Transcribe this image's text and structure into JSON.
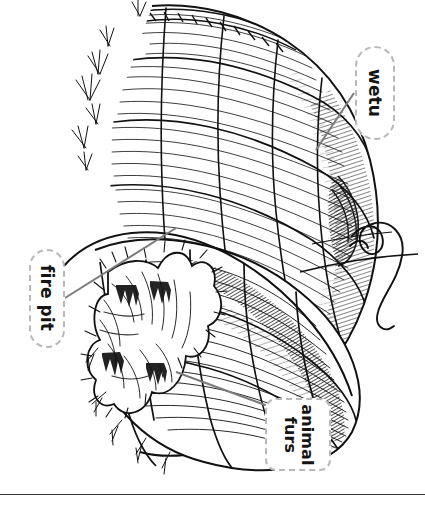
{
  "page": {
    "background_color": "#ffffff",
    "ink_color": "#111111",
    "rule_color": "#3a3a3a",
    "orientation": "rotated-90"
  },
  "illustration": {
    "name": "wetu-cutaway-illustration",
    "subject": "wetu",
    "style": "pen-and-ink line drawing",
    "description": "Domed bark-shingled Wampanoag wetu shown in cutaway with an animal-fur door covering and a wisp of smoke rising from the smoke hole"
  },
  "labels": [
    {
      "id": "wetu",
      "name": "callout-wetu",
      "text": "wetu",
      "lines": [
        "wetu"
      ],
      "border_color": "#b9b9b9",
      "border_style": "dashed",
      "fill": "#ffffff",
      "text_color": "#141414",
      "rotation_deg": 90
    },
    {
      "id": "fire-pit",
      "name": "callout-fire-pit",
      "text": "fire pit",
      "lines": [
        "fire pit"
      ],
      "border_color": "#b9b9b9",
      "border_style": "dashed",
      "fill": "#ffffff",
      "text_color": "#141414",
      "rotation_deg": 90
    },
    {
      "id": "animal-furs",
      "name": "callout-animal-furs",
      "text": "animal furs",
      "lines": [
        "animal",
        "furs"
      ],
      "border_color": "#b9b9b9",
      "border_style": "dashed",
      "fill": "#ffffff",
      "text_color": "#141414",
      "rotation_deg": 90
    }
  ],
  "leader_lines": [
    {
      "name": "leader-line-wetu",
      "from_label": "wetu",
      "color": "#7b7b7b"
    },
    {
      "name": "leader-line-fire-pit",
      "from_label": "fire pit",
      "color": "#7b7b7b"
    },
    {
      "name": "leader-line-animal-furs",
      "from_label": "animal furs",
      "color": "#7b7b7b"
    }
  ],
  "rule": {
    "name": "page-bottom-rule",
    "color": "#3a3a3a"
  }
}
